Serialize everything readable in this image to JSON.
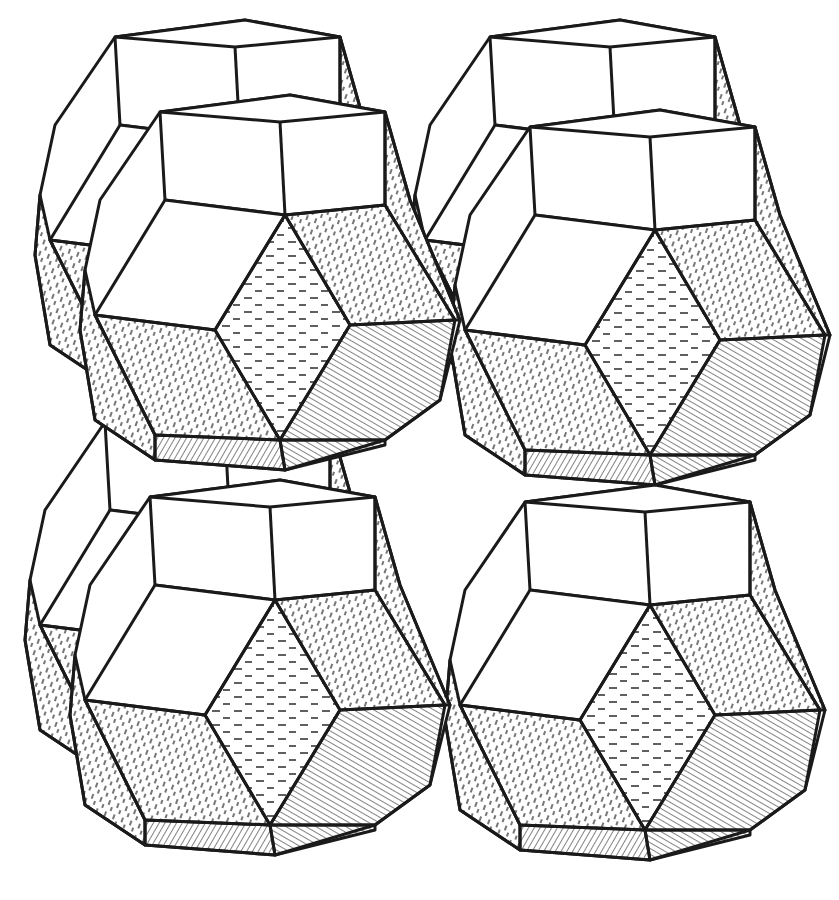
{
  "figure": {
    "cells": [
      {
        "id": "back-top-left",
        "dx": -45,
        "dy": -75
      },
      {
        "id": "back-top-right",
        "dx": 330,
        "dy": -75
      },
      {
        "id": "back-bottom-left",
        "dx": -55,
        "dy": 310
      },
      {
        "id": "front-top-left",
        "dx": 0,
        "dy": 0
      },
      {
        "id": "front-top-right",
        "dx": 370,
        "dy": 15
      },
      {
        "id": "front-bottom-left",
        "dx": -10,
        "dy": 385
      },
      {
        "id": "front-bottom-right",
        "dx": 365,
        "dy": 390
      }
    ],
    "colors": {
      "ink": "#1a1a1a",
      "paper": "#ffffff"
    }
  }
}
